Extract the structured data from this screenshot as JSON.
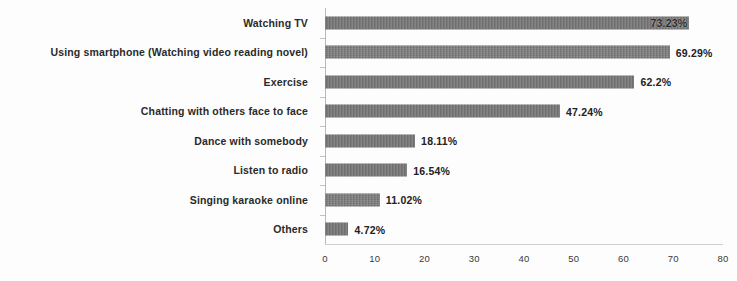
{
  "chart_data": {
    "type": "bar",
    "orientation": "horizontal",
    "title": "",
    "subtitle": "",
    "xlabel": "",
    "ylabel": "",
    "xlim": [
      0,
      80
    ],
    "xticks": [
      0,
      10,
      20,
      30,
      40,
      50,
      60,
      70,
      80
    ],
    "xtick_labels": [
      "0",
      "10",
      "20",
      "30",
      "40",
      "50",
      "60",
      "70",
      "80"
    ],
    "grid": false,
    "legend": null,
    "value_suffix": "%",
    "bar_color": "#6f6f6f",
    "axis_color": "#b9b9b9",
    "categories": [
      "Watching TV",
      "Using smartphone (Watching video reading novel)",
      "Exercise",
      "Chatting with others face to face",
      "Dance with somebody",
      "Listen to radio",
      "Singing karaoke online",
      "Others"
    ],
    "values": [
      73.23,
      69.29,
      62.2,
      47.24,
      18.11,
      16.54,
      11.02,
      4.72
    ],
    "data_labels": [
      "73.23%",
      "69.29%",
      "62.2%",
      "47.24%",
      "18.11%",
      "16.54%",
      "11.02%",
      "4.72%"
    ],
    "label_placement": [
      "inside",
      "outside",
      "outside",
      "outside",
      "outside",
      "outside",
      "outside",
      "outside"
    ]
  }
}
